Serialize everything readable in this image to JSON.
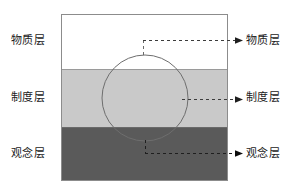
{
  "diagram": {
    "frame": {
      "x": 61,
      "y": 14,
      "width": 167,
      "height": 167,
      "border_color": "#8c8c8c"
    },
    "layers": [
      {
        "key": "material",
        "label": "物质层",
        "fill": "#ffffff",
        "y_top": 14,
        "y_bottom": 69
      },
      {
        "key": "institution",
        "label": "制度层",
        "fill": "#c9c9c9",
        "y_top": 69,
        "y_bottom": 127
      },
      {
        "key": "concept",
        "label": "观念层",
        "fill": "#5a5a5a",
        "y_top": 127,
        "y_bottom": 181
      }
    ],
    "circle": {
      "name": "overlay-circle",
      "cx": 145,
      "cy": 98,
      "r": 43,
      "stroke": "#6e6e6e",
      "fill": "none"
    },
    "connectors": [
      {
        "key": "material",
        "label": "物质层",
        "line_y": 40,
        "x_start": 143,
        "x_end": 240,
        "stem_x": 143,
        "stem_y_start": 40,
        "stem_y_end": 56,
        "stroke": "#3c3c3c",
        "dash": "3 3",
        "arrow": "▶"
      },
      {
        "key": "institution",
        "label": "制度层",
        "line_y": 99,
        "x_start": 182,
        "x_end": 240,
        "stem_x": null,
        "stem_y_start": null,
        "stem_y_end": null,
        "stroke": "#3c3c3c",
        "dash": "3 3",
        "arrow": "▶"
      },
      {
        "key": "concept",
        "label": "观念层",
        "line_y": 153,
        "x_start": 145,
        "x_end": 240,
        "stem_x": 145,
        "stem_y_start": 140,
        "stem_y_end": 153,
        "stroke": "#1f1f1f",
        "dash": "3 3",
        "arrow": "▶"
      }
    ]
  },
  "labels_left": {
    "material": "物质层",
    "institution": "制度层",
    "concept": "观念层"
  },
  "labels_right": {
    "material": "物质层",
    "institution": "制度层",
    "concept": "观念层"
  },
  "colors": {
    "material_fill": "#ffffff",
    "institution_fill": "#c9c9c9",
    "concept_fill": "#5a5a5a",
    "frame_border": "#8c8c8c",
    "circle_stroke": "#6e6e6e",
    "text": "#1b1b1b",
    "background": "#ffffff"
  }
}
